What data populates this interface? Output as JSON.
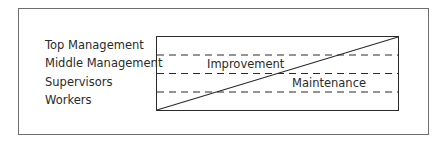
{
  "diagram": {
    "levels": [
      {
        "label": "Top Management"
      },
      {
        "label": "Middle Management"
      },
      {
        "label": "Supervisors"
      },
      {
        "label": "Workers"
      }
    ],
    "regions": {
      "upper": "Improvement",
      "lower": "Maintenance"
    },
    "colors": {
      "frame": "#6e6e6e",
      "lines": "#2a2a2a",
      "text": "#2a2a2a"
    }
  }
}
